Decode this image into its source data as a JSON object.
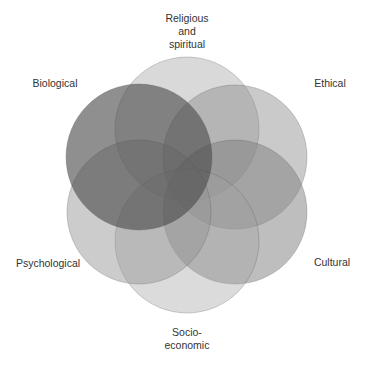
{
  "diagram": {
    "type": "venn",
    "labels": {
      "religious": "Religious\nand\nspiritual",
      "biological": "Biological",
      "ethical": "Ethical",
      "psychological": "Psychological",
      "cultural": "Cultural",
      "socioeconomic": "Socio-\neconomic"
    },
    "circles": [
      {
        "name": "religious",
        "cx": 187,
        "cy": 129,
        "r": 72,
        "fill": "#9a9a9a",
        "opacity": 0.38
      },
      {
        "name": "ethical",
        "cx": 235,
        "cy": 157,
        "r": 72,
        "fill": "#8a8a8a",
        "opacity": 0.45
      },
      {
        "name": "cultural",
        "cx": 235,
        "cy": 212,
        "r": 72,
        "fill": "#7e7e7e",
        "opacity": 0.5
      },
      {
        "name": "socioeconomic",
        "cx": 187,
        "cy": 241,
        "r": 72,
        "fill": "#a0a0a0",
        "opacity": 0.38
      },
      {
        "name": "psychological",
        "cx": 139,
        "cy": 212,
        "r": 72,
        "fill": "#949494",
        "opacity": 0.48
      },
      {
        "name": "biological",
        "cx": 139,
        "cy": 157,
        "r": 73,
        "fill": "#4a4a4a",
        "opacity": 0.62
      }
    ]
  }
}
